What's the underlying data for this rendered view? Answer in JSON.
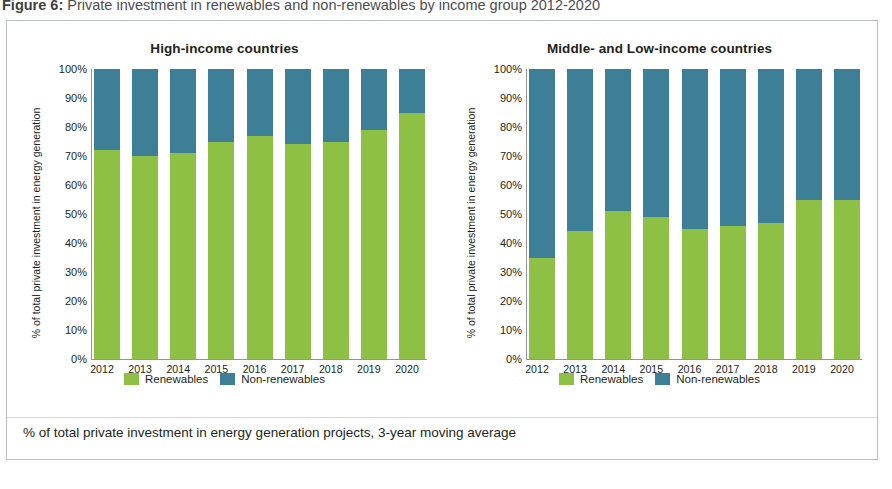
{
  "figure": {
    "number": "Figure 6:",
    "caption": "Private investment in renewables and non-renewables by income group 2012-2020"
  },
  "footnote": "% of total private investment in energy generation projects, 3-year moving average",
  "legend": {
    "renewables_label": "Renewables",
    "nonrenewables_label": "Non-renewables"
  },
  "colors": {
    "renewables": "#8dc044",
    "nonrenewables": "#3d7f96",
    "axis": "#939598",
    "border": "#b9bcbe",
    "text": "#231f20"
  },
  "axis": {
    "y_title": "% of total private investment in energy generation",
    "ticks": [
      "100%",
      "90%",
      "80%",
      "70%",
      "60%",
      "50%",
      "40%",
      "30%",
      "20%",
      "10%",
      "0%"
    ]
  },
  "charts": [
    {
      "title": "High-income countries",
      "y_title": "% of total private investment in energy generation"
    },
    {
      "title": "Middle- and Low-income countries",
      "y_title": "% of total private investment in energy generation"
    }
  ],
  "chart_data": [
    {
      "type": "bar",
      "title": "High-income countries",
      "subtype": "stacked-100",
      "categories": [
        "2012",
        "2013",
        "2014",
        "2015",
        "2016",
        "2017",
        "2018",
        "2019",
        "2020"
      ],
      "series": [
        {
          "name": "Renewables",
          "color": "#8dc044",
          "values": [
            72,
            70,
            71,
            75,
            77,
            74,
            75,
            79,
            85
          ]
        },
        {
          "name": "Non-renewables",
          "color": "#3d7f96",
          "values": [
            28,
            30,
            29,
            25,
            23,
            26,
            25,
            21,
            15
          ]
        }
      ],
      "xlabel": "",
      "ylabel": "% of total private investment in energy generation",
      "ylim": [
        0,
        100
      ],
      "yticks": [
        0,
        10,
        20,
        30,
        40,
        50,
        60,
        70,
        80,
        90,
        100
      ],
      "ytick_labels": [
        "0%",
        "10%",
        "20%",
        "30%",
        "40%",
        "50%",
        "60%",
        "70%",
        "80%",
        "90%",
        "100%"
      ],
      "grid": false,
      "legend_position": "bottom"
    },
    {
      "type": "bar",
      "title": "Middle- and Low-income countries",
      "subtype": "stacked-100",
      "categories": [
        "2012",
        "2013",
        "2014",
        "2015",
        "2016",
        "2017",
        "2018",
        "2019",
        "2020"
      ],
      "series": [
        {
          "name": "Renewables",
          "color": "#8dc044",
          "values": [
            35,
            44,
            51,
            49,
            45,
            46,
            47,
            55,
            55
          ]
        },
        {
          "name": "Non-renewables",
          "color": "#3d7f96",
          "values": [
            65,
            56,
            49,
            51,
            55,
            54,
            53,
            45,
            45
          ]
        }
      ],
      "xlabel": "",
      "ylabel": "% of total private investment in energy generation",
      "ylim": [
        0,
        100
      ],
      "yticks": [
        0,
        10,
        20,
        30,
        40,
        50,
        60,
        70,
        80,
        90,
        100
      ],
      "ytick_labels": [
        "0%",
        "10%",
        "20%",
        "30%",
        "40%",
        "50%",
        "60%",
        "70%",
        "80%",
        "90%",
        "100%"
      ],
      "grid": false,
      "legend_position": "bottom"
    }
  ]
}
